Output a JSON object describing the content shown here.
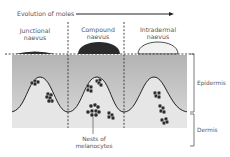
{
  "title": "Evolution of moles",
  "stages": [
    {
      "line1": "Junctional",
      "line2": "naevus",
      "fill": "#2a2a2a"
    },
    {
      "line1": "Compound",
      "line2": "naevus",
      "fill": "#2a2a2a"
    },
    {
      "line1": "Intradermal",
      "line2": "naevus",
      "fill": "#e8e8e8"
    }
  ],
  "layers": {
    "epidermis": "Epidermis",
    "dermis": "Dermis"
  },
  "callout": {
    "line1": "Nests of",
    "line2": "melanocytes"
  },
  "colors": {
    "epidermis_top": "#b5b5b5",
    "epidermis_bottom": "#d6d6d6",
    "dermis": "#e6e6e6",
    "line": "#222222"
  }
}
